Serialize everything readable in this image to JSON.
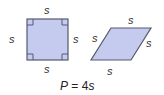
{
  "diagram": {
    "square": {
      "labels": {
        "top": "s",
        "bottom": "s",
        "left": "s",
        "right": "s"
      },
      "fill": "#c5cbee",
      "stroke": "#555a6e"
    },
    "rhombus": {
      "labels": {
        "top": "s",
        "bottom": "s",
        "left": "s",
        "right": "s"
      },
      "fill": "#c5cbee",
      "stroke": "#555a6e"
    },
    "formula": {
      "lhs": "P",
      "eq": " = 4",
      "var": "s"
    }
  }
}
